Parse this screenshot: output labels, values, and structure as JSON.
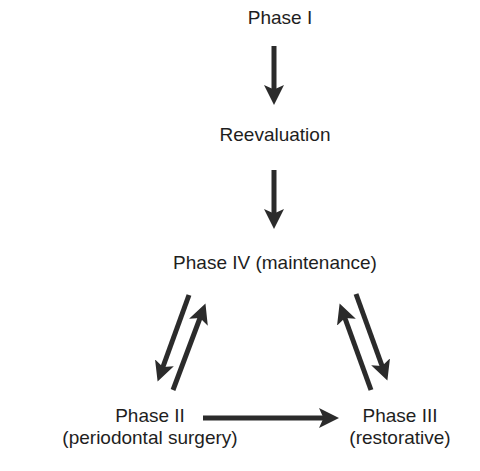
{
  "diagram": {
    "type": "flow",
    "nodes": {
      "phase1": {
        "label": "Phase I"
      },
      "reevaluation": {
        "label": "Reevaluation"
      },
      "phase4": {
        "label": "Phase IV (maintenance)"
      },
      "phase2": {
        "line1": "Phase II",
        "line2": "(periodontal surgery)"
      },
      "phase3": {
        "line1": "Phase III",
        "line2": "(restorative)"
      }
    },
    "edges": [
      {
        "from": "Phase I",
        "to": "Reevaluation"
      },
      {
        "from": "Reevaluation",
        "to": "Phase IV (maintenance)"
      },
      {
        "from": "Phase IV (maintenance)",
        "to": "Phase II"
      },
      {
        "from": "Phase II",
        "to": "Phase IV (maintenance)"
      },
      {
        "from": "Phase IV (maintenance)",
        "to": "Phase III"
      },
      {
        "from": "Phase III",
        "to": "Phase IV (maintenance)"
      },
      {
        "from": "Phase II",
        "to": "Phase III"
      }
    ],
    "colors": {
      "arrow": "#2b2b2b",
      "text": "#1e1e1e",
      "background": "#ffffff"
    }
  },
  "caption": {
    "text": ""
  }
}
